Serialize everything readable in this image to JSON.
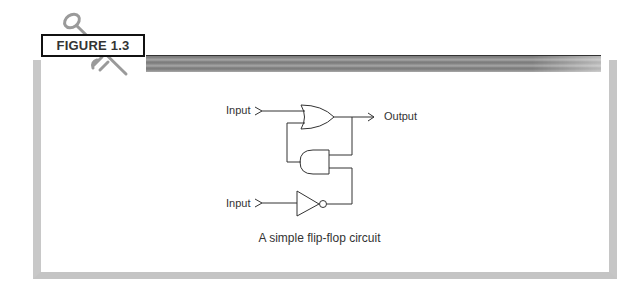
{
  "figure": {
    "label": "FIGURE 1.3",
    "caption": "A simple flip-flop circuit"
  },
  "diagram": {
    "inputs": [
      {
        "label": "Input",
        "connects_to": "or-gate"
      },
      {
        "label": "Input",
        "connects_to": "not-gate"
      }
    ],
    "output": {
      "label": "Output",
      "from": "or-gate"
    },
    "gates": [
      "or-gate",
      "and-gate",
      "not-gate"
    ],
    "icons": [
      "key-icon"
    ]
  },
  "colors": {
    "frame": "#c8c8c8",
    "stroke": "#333333",
    "label_border": "#111111"
  }
}
